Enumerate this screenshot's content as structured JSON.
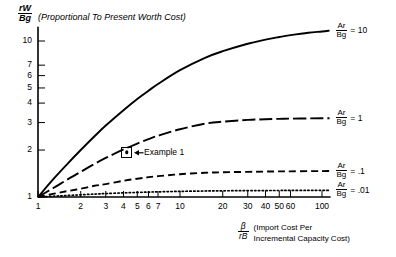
{
  "chart_data": {
    "type": "line",
    "title": "",
    "xlabel_fraction": {
      "numerator": "β",
      "denominator": "rB"
    },
    "xlabel_note_line1": "(Import Cost Per",
    "xlabel_note_line2": "Incremental Capacity Cost)",
    "ylabel_fraction": {
      "numerator": "rW",
      "denominator": "Bg"
    },
    "ylabel_note": "(Proportional To Present Worth Cost)",
    "xscale": "log",
    "yscale": "log",
    "xlim": [
      1,
      115
    ],
    "ylim": [
      1,
      12
    ],
    "grid": false,
    "legend_position": "right-of-curve-end",
    "xticks": [
      1,
      2,
      3,
      4,
      5,
      6,
      7,
      10,
      20,
      30,
      40,
      50,
      60,
      100
    ],
    "xtick_labels": [
      "1",
      "2",
      "3",
      "4",
      "5",
      "6",
      "7",
      "10",
      "20",
      "30",
      "40",
      "50",
      "60",
      "100"
    ],
    "yticks": [
      1,
      2,
      3,
      4,
      5,
      6,
      7,
      10
    ],
    "ytick_labels": [
      "1",
      "2",
      "3",
      "4",
      "5",
      "6",
      "7",
      "10"
    ],
    "x": [
      1,
      1.3,
      1.6,
      2,
      2.5,
      3,
      4,
      5,
      6,
      7,
      10,
      15,
      20,
      30,
      40,
      50,
      60,
      80,
      100,
      113
    ],
    "series": [
      {
        "name": "Ar/Bg = 10",
        "label_numerator": "Ar",
        "label_denominator": "Bg",
        "label_value": "= 10",
        "style": "solid",
        "color": "#000000",
        "values": [
          1.0,
          1.32,
          1.62,
          2.0,
          2.45,
          2.87,
          3.6,
          4.25,
          4.8,
          5.3,
          6.5,
          7.8,
          8.6,
          9.6,
          10.2,
          10.6,
          10.9,
          11.3,
          11.5,
          11.65
        ]
      },
      {
        "name": "Ar/Bg = 1",
        "label_numerator": "Ar",
        "label_denominator": "Bg",
        "label_value": "= 1",
        "style": "dash-dot-long",
        "color": "#000000",
        "values": [
          1.0,
          1.15,
          1.29,
          1.45,
          1.63,
          1.78,
          2.02,
          2.2,
          2.35,
          2.47,
          2.72,
          2.95,
          3.04,
          3.12,
          3.15,
          3.17,
          3.18,
          3.19,
          3.2,
          3.2
        ]
      },
      {
        "name": "Ar/Bg = .1",
        "label_numerator": "Ar",
        "label_denominator": "Bg",
        "label_value": "= .1",
        "style": "dashed",
        "color": "#000000",
        "values": [
          1.0,
          1.05,
          1.09,
          1.13,
          1.18,
          1.21,
          1.27,
          1.31,
          1.34,
          1.36,
          1.4,
          1.43,
          1.44,
          1.45,
          1.455,
          1.46,
          1.46,
          1.465,
          1.465,
          1.47
        ]
      },
      {
        "name": "Ar/Bg = .01",
        "label_numerator": "Ar",
        "label_denominator": "Bg",
        "label_value": "= .01",
        "style": "dotted",
        "color": "#000000",
        "values": [
          1.0,
          1.012,
          1.022,
          1.033,
          1.044,
          1.052,
          1.063,
          1.07,
          1.075,
          1.079,
          1.087,
          1.093,
          1.096,
          1.099,
          1.1,
          1.101,
          1.102,
          1.103,
          1.104,
          1.104
        ]
      }
    ],
    "annotations": [
      {
        "name": "Example 1",
        "label": "Example 1",
        "marker": "square-with-dot",
        "x": 4.2,
        "y": 1.92
      }
    ]
  }
}
